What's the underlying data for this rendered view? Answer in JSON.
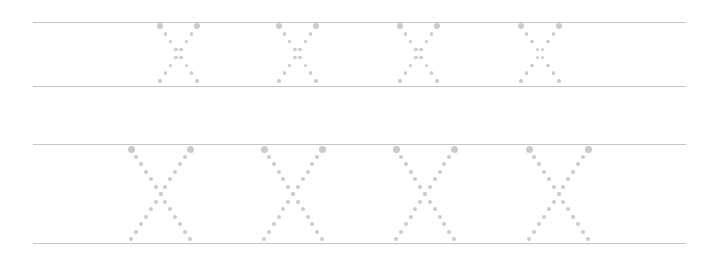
{
  "worksheet": {
    "letter": "X",
    "dot_color": "#cbcbcb",
    "line_color": "#c6c6c6",
    "rows": [
      {
        "name": "small-row",
        "top_line_y": 22,
        "bottom_line_y": 86,
        "line_x_start": 33,
        "line_x_end": 686,
        "letters": [
          {
            "x": 160,
            "y": 26,
            "w": 37,
            "h": 55
          },
          {
            "x": 279,
            "y": 26,
            "w": 37,
            "h": 55
          },
          {
            "x": 400,
            "y": 26,
            "w": 37,
            "h": 55
          },
          {
            "x": 521,
            "y": 26,
            "w": 38,
            "h": 55
          }
        ],
        "dots_per_stroke": 8
      },
      {
        "name": "large-row",
        "top_line_y": 144,
        "bottom_line_y": 243,
        "line_x_start": 33,
        "line_x_end": 686,
        "letters": [
          {
            "x": 131,
            "y": 149,
            "w": 59,
            "h": 90
          },
          {
            "x": 264,
            "y": 149,
            "w": 58,
            "h": 90
          },
          {
            "x": 396,
            "y": 149,
            "w": 58,
            "h": 90
          },
          {
            "x": 529,
            "y": 149,
            "w": 59,
            "h": 90
          }
        ],
        "dots_per_stroke": 13
      }
    ]
  }
}
